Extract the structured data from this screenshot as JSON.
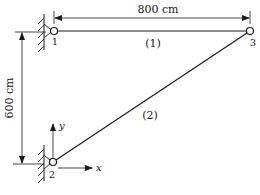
{
  "diagram": {
    "type": "two-bar truss",
    "dimensions": {
      "horizontal_label": "800 cm",
      "vertical_label": "600 cm"
    },
    "nodes": [
      {
        "id": "1",
        "label": "1",
        "support": "pin (wall)"
      },
      {
        "id": "2",
        "label": "2",
        "support": "pin (wall)"
      },
      {
        "id": "3",
        "label": "3",
        "support": "free"
      }
    ],
    "elements": [
      {
        "id": "1",
        "label": "(1)",
        "from": "1",
        "to": "3"
      },
      {
        "id": "2",
        "label": "(2)",
        "from": "2",
        "to": "3"
      }
    ],
    "axes": {
      "x_label": "x",
      "y_label": "y"
    }
  }
}
